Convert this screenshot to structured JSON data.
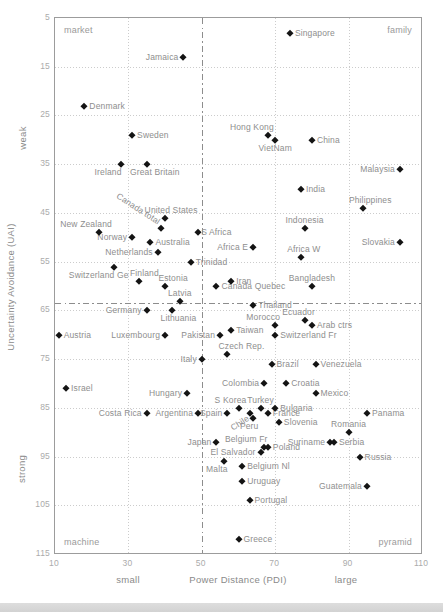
{
  "chart_data": {
    "type": "scatter",
    "title": "",
    "xlabel": "Power Distance (PDI)",
    "ylabel": "Uncertainty Avoidance (UAI)",
    "x_qualifier_low": "small",
    "x_qualifier_high": "large",
    "y_qualifier_low": "weak",
    "y_qualifier_high": "strong",
    "xlim": [
      10,
      110
    ],
    "ylim": [
      5,
      115
    ],
    "y_axis_inverted": true,
    "x_ticks": [
      10,
      30,
      50,
      70,
      90,
      110
    ],
    "y_ticks": [
      5,
      15,
      25,
      35,
      45,
      55,
      65,
      75,
      85,
      95,
      105,
      115
    ],
    "x_gridlines": [
      30,
      70,
      90
    ],
    "y_gridlines": [
      15,
      25,
      35,
      45,
      55,
      65,
      75,
      85,
      95,
      105
    ],
    "divider_vertical_pdi": 50,
    "divider_horizontal_uai": 63.5,
    "corner_labels": {
      "top_left": "market",
      "top_right": "family",
      "bottom_left": "machine",
      "bottom_right": "pyramid"
    },
    "points": [
      {
        "name": "Singapore",
        "pdi": 74,
        "uai": 8,
        "label_side": "right"
      },
      {
        "name": "Jamaica",
        "pdi": 45,
        "uai": 13,
        "label_side": "left"
      },
      {
        "name": "Denmark",
        "pdi": 18,
        "uai": 23,
        "label_side": "right"
      },
      {
        "name": "Sweden",
        "pdi": 31,
        "uai": 29,
        "label_side": "right"
      },
      {
        "name": "Hong Kong",
        "pdi": 68,
        "uai": 29,
        "label_side": "above",
        "dx": -16
      },
      {
        "name": "VietNam",
        "pdi": 70,
        "uai": 30,
        "label_side": "below"
      },
      {
        "name": "China",
        "pdi": 80,
        "uai": 30,
        "label_side": "right"
      },
      {
        "name": "Ireland",
        "pdi": 28,
        "uai": 35,
        "label_side": "below",
        "dx": -13
      },
      {
        "name": "Great Britain",
        "pdi": 35,
        "uai": 35,
        "label_side": "below",
        "dx": 8
      },
      {
        "name": "Malaysia",
        "pdi": 104,
        "uai": 36,
        "label_side": "left"
      },
      {
        "name": "India",
        "pdi": 77,
        "uai": 40,
        "label_side": "right"
      },
      {
        "name": "Philippines",
        "pdi": 94,
        "uai": 44,
        "label_side": "above",
        "dx": 7
      },
      {
        "name": "United States",
        "pdi": 40,
        "uai": 46,
        "label_side": "above",
        "dx": 6
      },
      {
        "name": "Canada total",
        "pdi": 39,
        "uai": 48,
        "label_side": "diag-down"
      },
      {
        "name": "Indonesia",
        "pdi": 78,
        "uai": 48,
        "label_side": "above"
      },
      {
        "name": "New Zealand",
        "pdi": 22,
        "uai": 49,
        "label_side": "above",
        "dx": -13
      },
      {
        "name": "S Africa",
        "pdi": 49,
        "uai": 49,
        "label_side": "right",
        "dx": -2
      },
      {
        "name": "Norway",
        "pdi": 31,
        "uai": 50,
        "label_side": "left"
      },
      {
        "name": "Australia",
        "pdi": 36,
        "uai": 51,
        "label_side": "right"
      },
      {
        "name": "Slovakia",
        "pdi": 104,
        "uai": 51,
        "label_side": "left"
      },
      {
        "name": "Africa E",
        "pdi": 64,
        "uai": 52,
        "label_side": "left"
      },
      {
        "name": "Netherlands",
        "pdi": 38,
        "uai": 53,
        "label_side": "left"
      },
      {
        "name": "Africa W",
        "pdi": 77,
        "uai": 54,
        "label_side": "above",
        "dx": 3
      },
      {
        "name": "Trinidad",
        "pdi": 47,
        "uai": 55,
        "label_side": "right"
      },
      {
        "name": "Switzerland Ge",
        "pdi": 26,
        "uai": 56,
        "label_side": "below",
        "dx": -15
      },
      {
        "name": "Finland",
        "pdi": 33,
        "uai": 59,
        "label_side": "above",
        "dx": 5
      },
      {
        "name": "Iran",
        "pdi": 58,
        "uai": 59,
        "label_side": "right"
      },
      {
        "name": "Estonia",
        "pdi": 40,
        "uai": 60,
        "label_side": "above",
        "dx": 8
      },
      {
        "name": "Bangladesh",
        "pdi": 80,
        "uai": 60,
        "label_side": "above"
      },
      {
        "name": "Canada Quebec",
        "pdi": 54,
        "uai": 60,
        "label_side": "right"
      },
      {
        "name": "Latvia",
        "pdi": 44,
        "uai": 63,
        "label_side": "above"
      },
      {
        "name": "Germany",
        "pdi": 35,
        "uai": 65,
        "label_side": "left"
      },
      {
        "name": "Lithuania",
        "pdi": 42,
        "uai": 65,
        "label_side": "below",
        "dx": 6
      },
      {
        "name": "Thailand",
        "pdi": 64,
        "uai": 64,
        "label_side": "right"
      },
      {
        "name": "Ecuador",
        "pdi": 78,
        "uai": 67,
        "label_side": "above",
        "dx": -6
      },
      {
        "name": "Morocco",
        "pdi": 70,
        "uai": 68,
        "label_side": "above",
        "dx": -12
      },
      {
        "name": "Arab ctrs",
        "pdi": 80,
        "uai": 68,
        "label_side": "right"
      },
      {
        "name": "Taiwan",
        "pdi": 58,
        "uai": 69,
        "label_side": "right"
      },
      {
        "name": "Austria",
        "pdi": 11,
        "uai": 70,
        "label_side": "right"
      },
      {
        "name": "Luxembourg",
        "pdi": 40,
        "uai": 70,
        "label_side": "left"
      },
      {
        "name": "Pakistan",
        "pdi": 55,
        "uai": 70,
        "label_side": "left"
      },
      {
        "name": "Switzerland Fr",
        "pdi": 70,
        "uai": 70,
        "label_side": "right"
      },
      {
        "name": "Czech Rep.",
        "pdi": 57,
        "uai": 74,
        "label_side": "above",
        "dx": 14
      },
      {
        "name": "Italy",
        "pdi": 50,
        "uai": 75,
        "label_side": "left"
      },
      {
        "name": "Brazil",
        "pdi": 69,
        "uai": 76,
        "label_side": "right"
      },
      {
        "name": "Venezuela",
        "pdi": 81,
        "uai": 76,
        "label_side": "right"
      },
      {
        "name": "Colombia",
        "pdi": 67,
        "uai": 80,
        "label_side": "left"
      },
      {
        "name": "Croatia",
        "pdi": 73,
        "uai": 80,
        "label_side": "right"
      },
      {
        "name": "Israel",
        "pdi": 13,
        "uai": 81,
        "label_side": "right"
      },
      {
        "name": "Hungary",
        "pdi": 46,
        "uai": 82,
        "label_side": "left"
      },
      {
        "name": "Mexico",
        "pdi": 81,
        "uai": 82,
        "label_side": "right"
      },
      {
        "name": "S Korea",
        "pdi": 60,
        "uai": 85,
        "label_side": "above",
        "dx": -8
      },
      {
        "name": "Turkey",
        "pdi": 66,
        "uai": 85,
        "label_side": "above"
      },
      {
        "name": "Bulgaria",
        "pdi": 70,
        "uai": 85,
        "label_side": "right"
      },
      {
        "name": "Costa Rica",
        "pdi": 35,
        "uai": 86,
        "label_side": "left"
      },
      {
        "name": "Argentina",
        "pdi": 49,
        "uai": 86,
        "label_side": "left"
      },
      {
        "name": "Spain",
        "pdi": 57,
        "uai": 86,
        "label_side": "left"
      },
      {
        "name": "Chile",
        "pdi": 63,
        "uai": 86,
        "label_side": "diag-up"
      },
      {
        "name": "France",
        "pdi": 68,
        "uai": 86,
        "label_side": "right"
      },
      {
        "name": "Panama",
        "pdi": 95,
        "uai": 86,
        "label_side": "right"
      },
      {
        "name": "Peru",
        "pdi": 64,
        "uai": 87,
        "label_side": "below",
        "dx": -4
      },
      {
        "name": "Slovenia",
        "pdi": 71,
        "uai": 88,
        "label_side": "right"
      },
      {
        "name": "Romania",
        "pdi": 90,
        "uai": 90,
        "label_side": "above"
      },
      {
        "name": "Japan",
        "pdi": 54,
        "uai": 92,
        "label_side": "left"
      },
      {
        "name": "Suriname",
        "pdi": 85,
        "uai": 92,
        "label_side": "left"
      },
      {
        "name": "Serbia",
        "pdi": 86,
        "uai": 92,
        "label_side": "right"
      },
      {
        "name": "Belgium Fr",
        "pdi": 67,
        "uai": 93,
        "label_side": "above",
        "dx": -18
      },
      {
        "name": "Poland",
        "pdi": 68,
        "uai": 93,
        "label_side": "right"
      },
      {
        "name": "El Salvador",
        "pdi": 66,
        "uai": 94,
        "label_side": "left"
      },
      {
        "name": "Russia",
        "pdi": 93,
        "uai": 95,
        "label_side": "right"
      },
      {
        "name": "Malta",
        "pdi": 56,
        "uai": 96,
        "label_side": "below",
        "dx": -7
      },
      {
        "name": "Belgium Nl",
        "pdi": 61,
        "uai": 97,
        "label_side": "right"
      },
      {
        "name": "Uruguay",
        "pdi": 61,
        "uai": 100,
        "label_side": "right"
      },
      {
        "name": "Guatemala",
        "pdi": 95,
        "uai": 101,
        "label_side": "left"
      },
      {
        "name": "Portugal",
        "pdi": 63,
        "uai": 104,
        "label_side": "right"
      },
      {
        "name": "Greece",
        "pdi": 60,
        "uai": 112,
        "label_side": "right"
      }
    ]
  },
  "colors": {
    "marker": "#141414",
    "point_label": "#8e8e8e",
    "tick_label": "#ababab",
    "grid": "#cccccc",
    "divider": "#8d8d8d",
    "border": "#9c9c9c",
    "bottom_bar": "#d5d5d5"
  }
}
